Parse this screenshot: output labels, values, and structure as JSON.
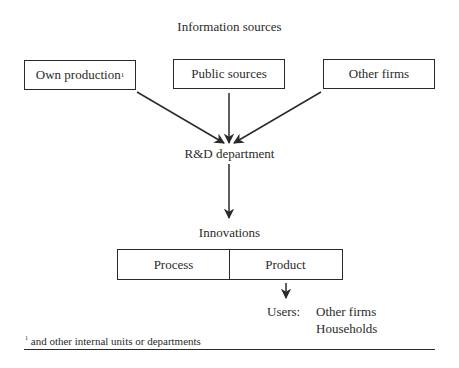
{
  "title": "Information sources",
  "sources": [
    {
      "label": "Own production",
      "footnote_mark": "1"
    },
    {
      "label": "Public sources"
    },
    {
      "label": "Other firms"
    }
  ],
  "rd_label": "R&D department",
  "innovations_label": "Innovations",
  "innovation_types": [
    {
      "label": "Process"
    },
    {
      "label": "Product"
    }
  ],
  "users": {
    "label": "Users:",
    "items": [
      "Other firms",
      "Households"
    ]
  },
  "footnote": {
    "mark": "1",
    "text": "and other internal units or departments"
  }
}
